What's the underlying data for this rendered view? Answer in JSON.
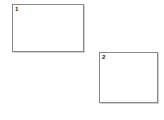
{
  "page": {
    "background_color": "#ffffff",
    "width": 164,
    "height": 120
  },
  "style": {
    "border_color": "#8a8a8a",
    "fill_color": "#ffffff",
    "shadow_color": "#aaaaaa",
    "label_color": "#1a1a1a"
  },
  "regions": [
    {
      "label": "1",
      "name": "region-box-1",
      "x": 12,
      "y": 4,
      "width": 72,
      "height": 48
    },
    {
      "label": "2",
      "name": "region-box-2",
      "x": 99,
      "y": 52,
      "width": 59,
      "height": 51
    }
  ]
}
